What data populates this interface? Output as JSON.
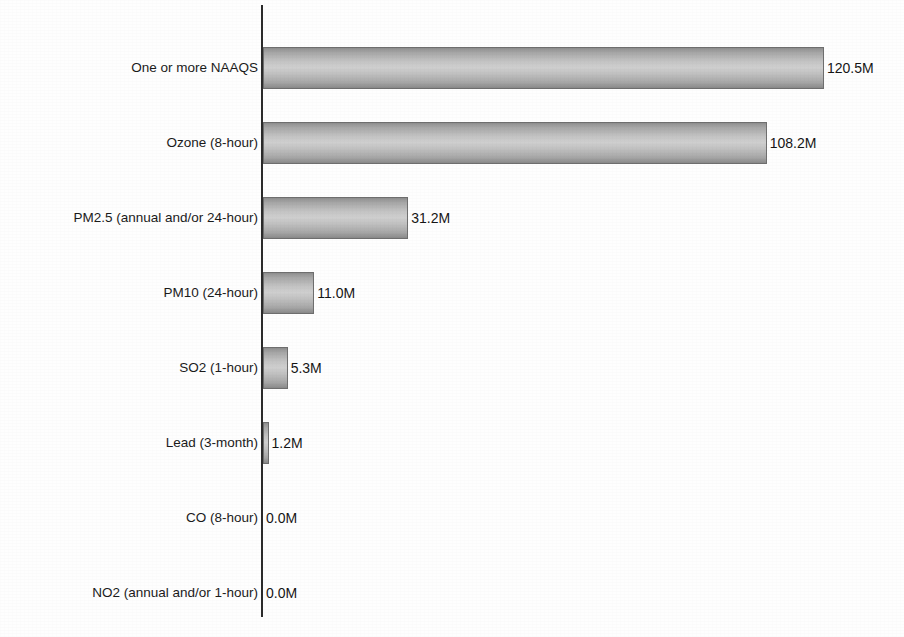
{
  "chart_data": {
    "type": "bar",
    "orientation": "horizontal",
    "title": "",
    "xlabel": "",
    "ylabel": "",
    "grid": false,
    "legend": false,
    "xlim": [
      0,
      120.5
    ],
    "unit_suffix": "M",
    "categories": [
      "One or more NAAQS",
      "Ozone (8-hour)",
      "PM2.5 (annual and/or 24-hour)",
      "PM10 (24-hour)",
      "SO2 (1-hour)",
      "Lead (3-month)",
      "CO (8-hour)",
      "NO2 (annual and/or 1-hour)"
    ],
    "values": [
      120.5,
      108.2,
      31.2,
      11.0,
      5.3,
      1.2,
      0.0,
      0.0
    ],
    "value_labels": [
      "120.5M",
      "108.2M",
      "31.2M",
      "11.0M",
      "5.3M",
      "1.2M",
      "0.0M",
      "0.0M"
    ],
    "bar_color": "#c2c2c2",
    "bar_edge_color": "#6e6e6e",
    "axis_color": "#2b2b2b",
    "background_color": "#ffffff"
  },
  "axis": {
    "y_axis_name": "category-axis"
  }
}
